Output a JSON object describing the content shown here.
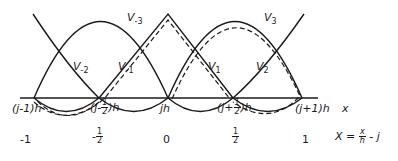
{
  "curve_labels": {
    "v_minus3": {
      "name": "V",
      "sub": "-3"
    },
    "v_minus2": {
      "name": "V",
      "sub": "-2"
    },
    "v_minus1": {
      "name": "V",
      "sub": "-1"
    },
    "v_1": {
      "name": "V",
      "sub": "1"
    },
    "v_2": {
      "name": "V",
      "sub": "2"
    },
    "v_3": {
      "name": "V",
      "sub": "3"
    }
  },
  "x_axis": {
    "label": "x",
    "ticks": [
      "(j-1)h",
      "(j-",
      "1",
      "2",
      ")h",
      "jh",
      "(j+",
      "1",
      "2",
      ")h",
      "(j+1)h"
    ]
  },
  "X_axis": {
    "ticks": [
      "-1",
      "-",
      "1",
      "2",
      "0",
      "1",
      "2",
      "1"
    ],
    "formula_lhs": "X =",
    "formula_num": "x",
    "formula_den": "h",
    "formula_rhs": "- j"
  },
  "colors": {
    "ink": "#1a1a1a",
    "background": "#ffffff"
  }
}
